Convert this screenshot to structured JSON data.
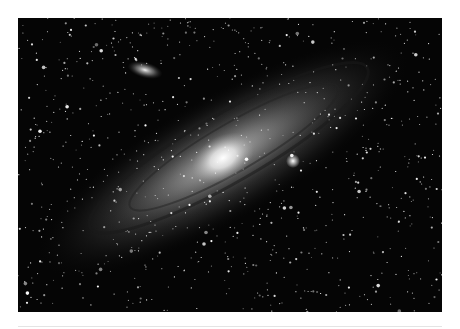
{
  "image": {
    "subject": "Andromeda galaxy (M31) with companion galaxy, star field",
    "background_color": "#050505",
    "galaxy_core_color": "#f4f4f4",
    "frame_color": "#ffffff"
  }
}
